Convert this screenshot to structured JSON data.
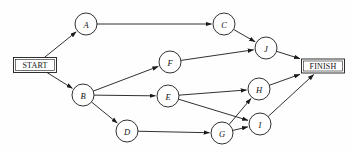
{
  "diagram": {
    "type": "directed-network",
    "canvas": {
      "width": 353,
      "height": 152
    },
    "colors": {
      "stroke": "#1a1a1a",
      "node_fill": "#ffffff",
      "background": "#fefefe",
      "label": "#111111"
    },
    "terminals": [
      {
        "id": "START",
        "label": "START",
        "x": 35,
        "y": 65,
        "w": 43,
        "h": 15
      },
      {
        "id": "FINISH",
        "label": "FINISH",
        "x": 323,
        "y": 66,
        "w": 43,
        "h": 14
      }
    ],
    "nodes": [
      {
        "id": "A",
        "label": "A",
        "x": 86,
        "y": 24,
        "r": 11
      },
      {
        "id": "C",
        "label": "C",
        "x": 224,
        "y": 24,
        "r": 11
      },
      {
        "id": "J",
        "label": "J",
        "x": 266,
        "y": 48,
        "r": 11
      },
      {
        "id": "F",
        "label": "F",
        "x": 170,
        "y": 62,
        "r": 11
      },
      {
        "id": "B",
        "label": "B",
        "x": 83,
        "y": 95,
        "r": 11
      },
      {
        "id": "E",
        "label": "E",
        "x": 168,
        "y": 96,
        "r": 11
      },
      {
        "id": "H",
        "label": "H",
        "x": 259,
        "y": 89,
        "r": 11
      },
      {
        "id": "I",
        "label": "I",
        "x": 260,
        "y": 124,
        "r": 11
      },
      {
        "id": "G",
        "label": "G",
        "x": 222,
        "y": 133,
        "r": 11
      },
      {
        "id": "D",
        "label": "D",
        "x": 127,
        "y": 131,
        "r": 11
      }
    ],
    "edges": [
      {
        "from": "START",
        "to": "A"
      },
      {
        "from": "START",
        "to": "B"
      },
      {
        "from": "A",
        "to": "C"
      },
      {
        "from": "C",
        "to": "J"
      },
      {
        "from": "F",
        "to": "J"
      },
      {
        "from": "B",
        "to": "F"
      },
      {
        "from": "B",
        "to": "E"
      },
      {
        "from": "B",
        "to": "D"
      },
      {
        "from": "E",
        "to": "H"
      },
      {
        "from": "E",
        "to": "I"
      },
      {
        "from": "D",
        "to": "G"
      },
      {
        "from": "G",
        "to": "H"
      },
      {
        "from": "G",
        "to": "I"
      },
      {
        "from": "J",
        "to": "FINISH"
      },
      {
        "from": "H",
        "to": "FINISH"
      },
      {
        "from": "I",
        "to": "FINISH"
      }
    ]
  }
}
